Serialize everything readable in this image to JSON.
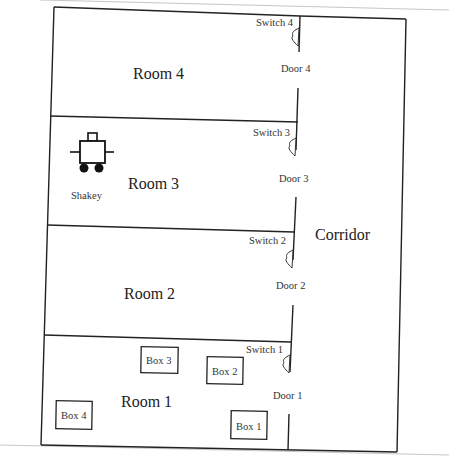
{
  "diagram": {
    "rooms": [
      {
        "id": "room4",
        "label": "Room 4",
        "switch": "Switch 4",
        "door": "Door 4"
      },
      {
        "id": "room3",
        "label": "Room 3",
        "switch": "Switch 3",
        "door": "Door 3"
      },
      {
        "id": "room2",
        "label": "Room 2",
        "switch": "Switch 2",
        "door": "Door 2"
      },
      {
        "id": "room1",
        "label": "Room 1",
        "switch": "Switch 1",
        "door": "Door 1"
      }
    ],
    "corridor": {
      "label": "Corridor"
    },
    "robot": {
      "label": "Shakey",
      "room": "Room 3"
    },
    "boxes": [
      {
        "label": "Box 1",
        "room": "Room 1"
      },
      {
        "label": "Box 2",
        "room": "Room 1"
      },
      {
        "label": "Box 3",
        "room": "Room 1"
      },
      {
        "label": "Box 4",
        "room": "Room 1"
      }
    ],
    "colors": {
      "line": "#222222",
      "background": "#ffffff"
    }
  }
}
